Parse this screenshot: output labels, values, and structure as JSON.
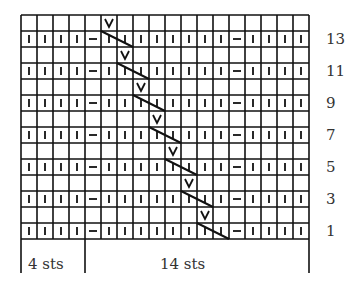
{
  "chart": {
    "title": "",
    "columns": 18,
    "rows": 14,
    "origin_x": 21,
    "origin_y": 15,
    "cell_w": 16,
    "cell_h": 16,
    "odd_row_pattern": [
      "|",
      "|",
      "|",
      "|",
      "-",
      "|",
      "|",
      "|",
      "|",
      "|",
      "|",
      "|",
      "|",
      "-",
      "|",
      "|",
      "|",
      "|"
    ],
    "slip_stitch_symbol": "V",
    "slip_columns_by_even_row": {
      "14": 5,
      "12": 6,
      "10": 7,
      "8": 8,
      "6": 9,
      "4": 10,
      "2": 11
    },
    "row_labels": [
      "13",
      "11",
      "9",
      "7",
      "5",
      "3",
      "1"
    ],
    "repeat_labels": [
      {
        "text": "4 sts",
        "from_col": 0,
        "to_col": 4
      },
      {
        "text": "14 sts",
        "from_col": 4,
        "to_col": 18
      }
    ]
  },
  "chart_data": {
    "type": "table",
    "stitch_counts": {
      "edge": "4 sts",
      "repeat": "14 sts"
    },
    "row_numbers": [
      1,
      3,
      5,
      7,
      9,
      11,
      13
    ],
    "legend_symbols": {
      "|": "knit",
      "-": "purl",
      "V": "slip stitch",
      "diagonal": "travelling slipped stitch"
    }
  }
}
